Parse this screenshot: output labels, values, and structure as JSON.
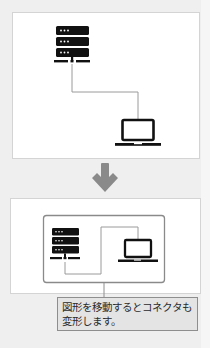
{
  "figure": {
    "title": "",
    "before": {
      "nodes": [
        {
          "id": "server",
          "icon": "server-icon"
        },
        {
          "id": "laptop",
          "icon": "laptop-icon"
        }
      ],
      "connector": {
        "from": "server",
        "to": "laptop",
        "style": "elbow"
      }
    },
    "transition": {
      "icon": "arrow-down-icon",
      "color": "#8a8a8a"
    },
    "after": {
      "group": {
        "border_color": "#8a8a8a"
      },
      "nodes": [
        {
          "id": "server",
          "icon": "server-icon"
        },
        {
          "id": "laptop",
          "icon": "laptop-icon"
        }
      ],
      "connector": {
        "from": "server",
        "to": "laptop",
        "style": "elbow"
      }
    },
    "callout": {
      "line1": "図形を移動するとコネクタも",
      "line2": "変形します。"
    }
  },
  "colors": {
    "background": "#efefef",
    "panel": "#ffffff",
    "icon": "#111111",
    "connector": "#9a9a9a",
    "callout_bg": "#e4e4e4",
    "callout_border": "#8e8e8e"
  }
}
